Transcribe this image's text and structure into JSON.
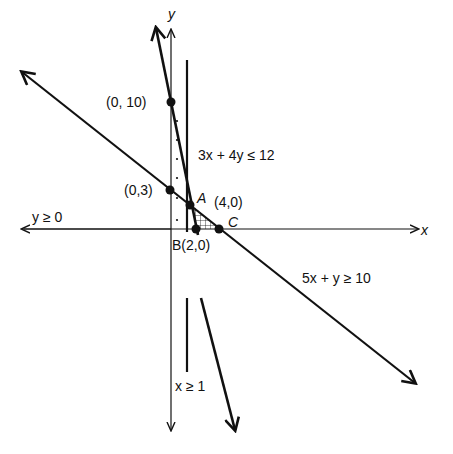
{
  "diagram": {
    "colors": {
      "ink": "#111111",
      "background": "#ffffff"
    },
    "axes": {
      "x_label": "x",
      "y_label": "y"
    },
    "points": {
      "p010": "(0, 10)",
      "p03": "(0,3)",
      "A": "A",
      "p40": "(4,0)",
      "B": "B(2,0)",
      "C": "C"
    },
    "constraints": {
      "c1": "3x + 4y ≤ 12",
      "c2": "5x + y ≥ 10",
      "c3": "y ≥ 0",
      "c4": "x ≥ 1"
    }
  }
}
